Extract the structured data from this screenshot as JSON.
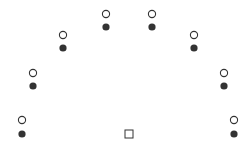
{
  "diagram": {
    "colors": {
      "stroke": "#333333",
      "fill": "#333333",
      "background": "#ffffff"
    },
    "pairs": [
      {
        "x": 22,
        "open_y": 120,
        "filled_y": 134
      },
      {
        "x": 33,
        "open_y": 73,
        "filled_y": 86
      },
      {
        "x": 63,
        "open_y": 35,
        "filled_y": 48
      },
      {
        "x": 106,
        "open_y": 14,
        "filled_y": 27
      },
      {
        "x": 152,
        "open_y": 14,
        "filled_y": 27
      },
      {
        "x": 194,
        "open_y": 35,
        "filled_y": 48
      },
      {
        "x": 224,
        "open_y": 73,
        "filled_y": 86
      },
      {
        "x": 234,
        "open_y": 120,
        "filled_y": 134
      }
    ],
    "center_square": {
      "x": 129,
      "y": 134,
      "size": 8
    }
  }
}
